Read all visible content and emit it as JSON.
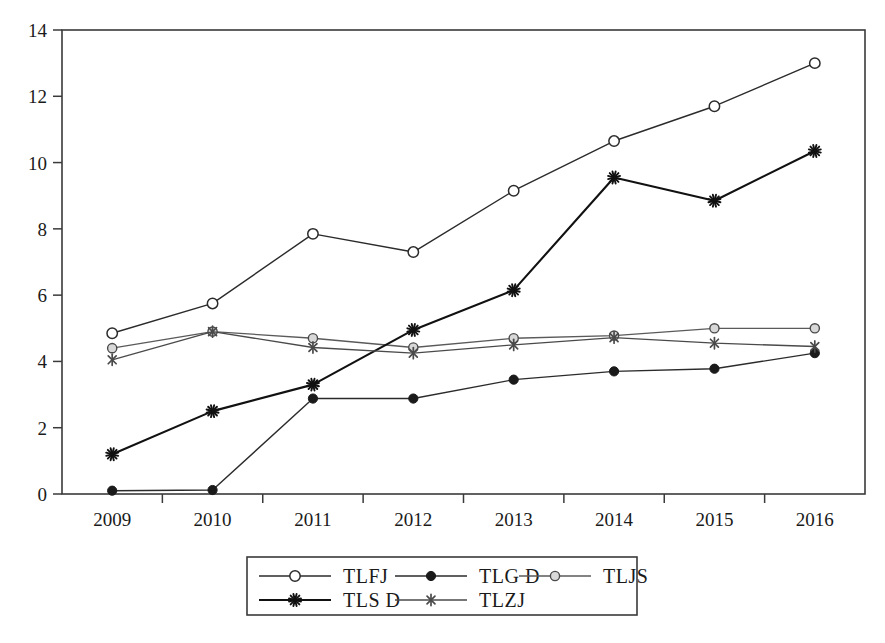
{
  "chart_data": {
    "type": "line",
    "title": "",
    "subtitle": "",
    "xlabel": "",
    "ylabel": "",
    "categories": [
      "2009",
      "2010",
      "2011",
      "2012",
      "2013",
      "2014",
      "2015",
      "2016"
    ],
    "x_tick_labels": [
      "2009",
      "2010",
      "2011",
      "2012",
      "2013",
      "2014",
      "2015",
      "2016"
    ],
    "y_tick_labels": [
      "0",
      "2",
      "4",
      "6",
      "8",
      "10",
      "12",
      "14"
    ],
    "y_ticks": [
      0,
      2,
      4,
      6,
      8,
      10,
      12,
      14
    ],
    "ylim": [
      0,
      14
    ],
    "grid": false,
    "legend_position": "bottom",
    "series": [
      {
        "name": "TLFJ",
        "marker": "open-circle",
        "color": "#2b2b2b",
        "line_width": 1.4,
        "values": [
          4.85,
          5.75,
          7.85,
          7.3,
          9.15,
          10.65,
          11.7,
          13.0
        ]
      },
      {
        "name": "TLG D",
        "marker": "filled-circle",
        "color": "#2b2b2b",
        "line_width": 1.4,
        "values": [
          0.1,
          0.12,
          2.88,
          2.88,
          3.45,
          3.7,
          3.78,
          4.25
        ]
      },
      {
        "name": "TLJS",
        "marker": "gray-circle",
        "color": "#5a5a5a",
        "line_width": 1.3,
        "values": [
          4.4,
          4.9,
          4.7,
          4.42,
          4.7,
          4.78,
          5.0,
          5.0
        ]
      },
      {
        "name": "TLS D",
        "marker": "asterisk",
        "color": "#111111",
        "line_width": 2.1,
        "values": [
          1.2,
          2.5,
          3.3,
          4.95,
          6.15,
          9.55,
          8.85,
          10.35
        ]
      },
      {
        "name": "TLZJ",
        "marker": "x-star",
        "color": "#4a4a4a",
        "line_width": 1.3,
        "values": [
          4.05,
          4.9,
          4.42,
          4.25,
          4.5,
          4.72,
          4.55,
          4.45
        ]
      }
    ],
    "legend_entries": [
      {
        "label": "TLFJ",
        "marker": "open-circle"
      },
      {
        "label": "TLG D",
        "marker": "filled-circle"
      },
      {
        "label": "TLJS",
        "marker": "gray-circle"
      },
      {
        "label": "TLS D",
        "marker": "asterisk"
      },
      {
        "label": "TLZJ",
        "marker": "x-star"
      }
    ]
  }
}
